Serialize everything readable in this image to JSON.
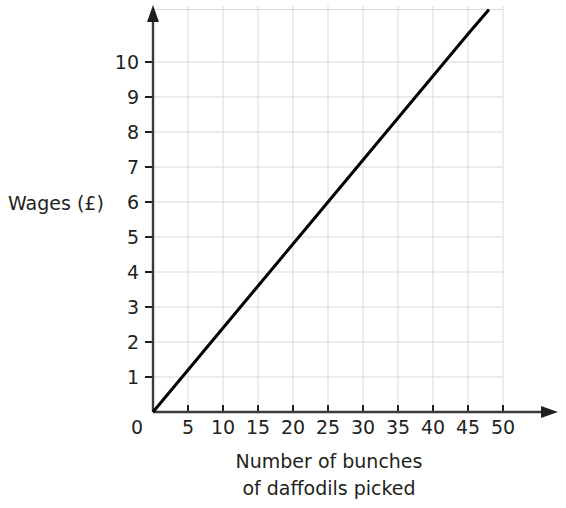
{
  "chart_data": {
    "type": "line",
    "title": "",
    "xlabel_line1": "Number of bunches",
    "xlabel_line2": "of daffodils picked",
    "ylabel": "Wages (£)",
    "xlim": [
      0,
      52
    ],
    "ylim": [
      0,
      11.6
    ],
    "xticks": [
      0,
      5,
      10,
      15,
      20,
      25,
      30,
      35,
      40,
      45,
      50
    ],
    "xtick_labels": [
      "0",
      "5",
      "10",
      "15",
      "20",
      "25",
      "30",
      "35",
      "40",
      "45",
      "50"
    ],
    "yticks": [
      0,
      1,
      2,
      3,
      4,
      5,
      6,
      7,
      8,
      9,
      10
    ],
    "ytick_labels": [
      "0",
      "1",
      "2",
      "3",
      "4",
      "5",
      "6",
      "7",
      "8",
      "9",
      "10"
    ],
    "grid": true,
    "grid_color": "#d9d9d9",
    "axis_color": "#231f20",
    "line_color": "#000000",
    "legend": "none",
    "series": [
      {
        "name": "Wages",
        "slope": 0.24,
        "intercept": 0,
        "x": [
          0,
          5,
          10,
          15,
          20,
          25,
          30,
          35,
          40,
          45,
          48
        ],
        "values": [
          0,
          1.2,
          2.4,
          3.6,
          4.8,
          6.0,
          7.2,
          8.4,
          9.6,
          10.8,
          11.5
        ]
      }
    ]
  },
  "axes": {
    "x_arrow": "arrow-right",
    "y_arrow": "arrow-up"
  }
}
